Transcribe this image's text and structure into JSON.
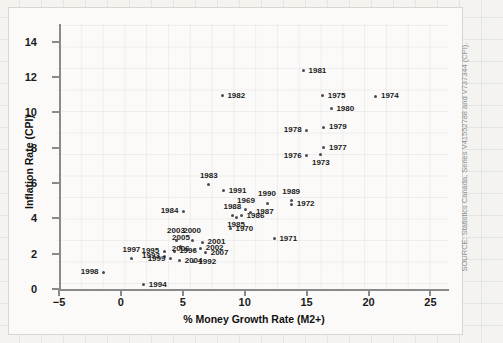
{
  "chart_data": {
    "type": "scatter",
    "title": "",
    "xlabel": "% Money Growth Rate (M2+)",
    "ylabel": "Inflation Rate (CPI)",
    "xlim": [
      -5,
      26.5
    ],
    "ylim": [
      0,
      15
    ],
    "xticks": [
      "−5",
      "0",
      "5",
      "10",
      "15",
      "20",
      "25"
    ],
    "xtick_values": [
      -5,
      0,
      5,
      10,
      15,
      20,
      25
    ],
    "yticks": [
      "0",
      "2",
      "4",
      "6",
      "8",
      "10",
      "12",
      "14"
    ],
    "ytick_values": [
      0,
      2,
      4,
      6,
      8,
      10,
      12,
      14
    ],
    "grid": true,
    "legend": null,
    "point_label_field": "year",
    "points": [
      {
        "year": "1998",
        "x": -1.4,
        "y": 0.95,
        "label_pos": "left"
      },
      {
        "year": "1994",
        "x": 1.85,
        "y": 0.25,
        "label_pos": "right"
      },
      {
        "year": "1997",
        "x": 0.85,
        "y": 1.7,
        "label_pos": "above"
      },
      {
        "year": "2003",
        "x": 4.45,
        "y": 2.75,
        "label_pos": "above"
      },
      {
        "year": "1995",
        "x": 3.5,
        "y": 2.15,
        "label_pos": "left"
      },
      {
        "year": "1993",
        "x": 3.55,
        "y": 1.85,
        "label_pos": "left"
      },
      {
        "year": "1999",
        "x": 4.0,
        "y": 1.7,
        "label_pos": "left"
      },
      {
        "year": "2005",
        "x": 4.85,
        "y": 2.4,
        "label_pos": "above"
      },
      {
        "year": "1996",
        "x": 4.3,
        "y": 2.15,
        "label_pos": "right"
      },
      {
        "year": "2004",
        "x": 4.75,
        "y": 1.6,
        "label_pos": "right"
      },
      {
        "year": "2000",
        "x": 5.75,
        "y": 2.75,
        "label_pos": "above"
      },
      {
        "year": "2006",
        "x": 5.95,
        "y": 2.25,
        "label_pos": "left"
      },
      {
        "year": "1992",
        "x": 5.85,
        "y": 1.55,
        "label_pos": "right"
      },
      {
        "year": "2001",
        "x": 6.6,
        "y": 2.65,
        "label_pos": "right"
      },
      {
        "year": "2002",
        "x": 6.45,
        "y": 2.3,
        "label_pos": "right"
      },
      {
        "year": "2007",
        "x": 6.85,
        "y": 2.05,
        "label_pos": "right"
      },
      {
        "year": "1984",
        "x": 5.05,
        "y": 4.4,
        "label_pos": "left"
      },
      {
        "year": "1983",
        "x": 7.1,
        "y": 5.9,
        "label_pos": "above"
      },
      {
        "year": "1991",
        "x": 8.3,
        "y": 5.55,
        "label_pos": "right"
      },
      {
        "year": "1988",
        "x": 9.0,
        "y": 4.15,
        "label_pos": "above"
      },
      {
        "year": "1985",
        "x": 9.3,
        "y": 4.05,
        "label_pos": "below"
      },
      {
        "year": "1986",
        "x": 9.75,
        "y": 4.15,
        "label_pos": "right"
      },
      {
        "year": "1969",
        "x": 10.1,
        "y": 4.5,
        "label_pos": "above"
      },
      {
        "year": "1987",
        "x": 10.5,
        "y": 4.35,
        "label_pos": "right"
      },
      {
        "year": "1970",
        "x": 8.85,
        "y": 3.4,
        "label_pos": "right"
      },
      {
        "year": "1990",
        "x": 11.8,
        "y": 4.85,
        "label_pos": "above"
      },
      {
        "year": "1989",
        "x": 13.75,
        "y": 5.0,
        "label_pos": "above"
      },
      {
        "year": "1972",
        "x": 13.8,
        "y": 4.8,
        "label_pos": "right"
      },
      {
        "year": "1971",
        "x": 12.4,
        "y": 2.85,
        "label_pos": "right"
      },
      {
        "year": "1976",
        "x": 15.0,
        "y": 7.55,
        "label_pos": "left"
      },
      {
        "year": "1973",
        "x": 16.15,
        "y": 7.6,
        "label_pos": "below"
      },
      {
        "year": "1977",
        "x": 16.4,
        "y": 8.0,
        "label_pos": "right"
      },
      {
        "year": "1978",
        "x": 15.0,
        "y": 9.0,
        "label_pos": "left"
      },
      {
        "year": "1979",
        "x": 16.4,
        "y": 9.15,
        "label_pos": "right"
      },
      {
        "year": "1980",
        "x": 17.0,
        "y": 10.2,
        "label_pos": "right"
      },
      {
        "year": "1975",
        "x": 16.3,
        "y": 10.95,
        "label_pos": "right"
      },
      {
        "year": "1974",
        "x": 20.6,
        "y": 10.9,
        "label_pos": "right"
      },
      {
        "year": "1982",
        "x": 8.2,
        "y": 10.95,
        "label_pos": "right"
      },
      {
        "year": "1981",
        "x": 14.75,
        "y": 12.35,
        "label_pos": "right"
      }
    ]
  },
  "source": {
    "text": "SOURCE: Statistics Canada, Series V41552788 and V737344 (CPI)."
  }
}
